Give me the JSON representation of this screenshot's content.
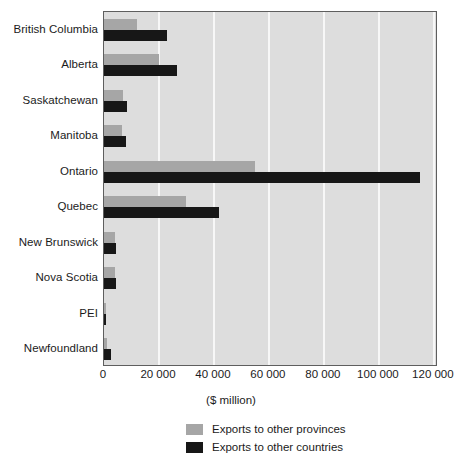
{
  "chart_data": {
    "type": "bar",
    "orientation": "horizontal",
    "title": "",
    "xlabel": "($ million)",
    "ylabel": "",
    "xlim": [
      0,
      121500
    ],
    "grid": true,
    "legend_position": "bottom",
    "categories": [
      "British Columbia",
      "Alberta",
      "Saskatchewan",
      "Manitoba",
      "Ontario",
      "Quebec",
      "New Brunswick",
      "Nova Scotia",
      "PEI",
      "Newfoundland"
    ],
    "xticks": [
      0,
      20000,
      40000,
      60000,
      80000,
      100000,
      120000
    ],
    "xtick_labels": [
      "0",
      "20 000",
      "40 000",
      "60 000",
      "80 000",
      "100 000",
      "120 000"
    ],
    "series": [
      {
        "name": "Exports to other provinces",
        "color": "#a6a6a6",
        "values": [
          12000,
          20000,
          7000,
          6500,
          55000,
          30000,
          4000,
          4000,
          600,
          1200
        ]
      },
      {
        "name": "Exports to other countries",
        "color": "#171717",
        "values": [
          23000,
          26500,
          8500,
          8000,
          115000,
          42000,
          4500,
          4500,
          700,
          2500
        ]
      }
    ]
  },
  "legend": {
    "items": [
      {
        "label": "Exports to other provinces",
        "swatch": "prov"
      },
      {
        "label": "Exports to other countries",
        "swatch": "ctry"
      }
    ]
  }
}
